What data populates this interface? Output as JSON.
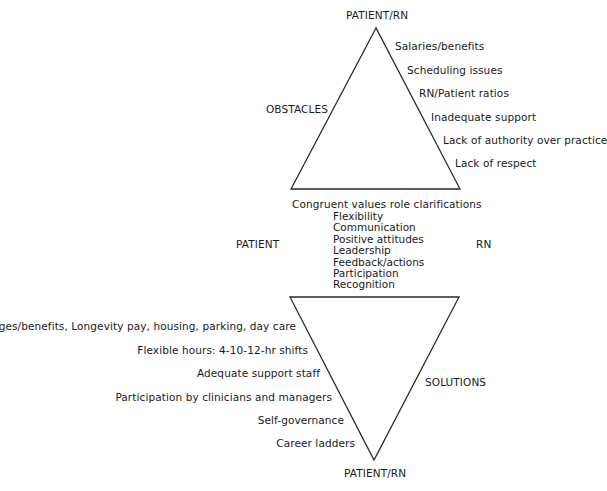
{
  "diagram": {
    "top_triangle": {
      "apex_label": "PATIENT/RN",
      "side_label": "OBSTACLES",
      "items": [
        "Salaries/benefits",
        "Scheduling issues",
        "RN/Patient ratios",
        "Inadequate support",
        "Lack of authority over practice",
        "Lack of respect"
      ]
    },
    "middle": {
      "left_label": "PATIENT",
      "right_label": "RN",
      "header": "Congruent values role clarifications",
      "items": [
        "Flexibility",
        "Communication",
        "Positive attitudes",
        "Leadership",
        "Feedback/actions",
        "Participation",
        "Recognition"
      ]
    },
    "bottom_triangle": {
      "apex_label": "PATIENT/RN",
      "side_label": "SOLUTIONS",
      "items": [
        "Wages/benefits, Longevity pay, housing, parking, day care",
        "Flexible hours: 4-10-12-hr shifts",
        "Adequate support staff",
        "Participation by clinicians and managers",
        "Self-governance",
        "Career ladders"
      ]
    },
    "colors": {
      "line": "#2a2a2a",
      "text": "#1a1a1a",
      "background": "#ffffff"
    }
  }
}
